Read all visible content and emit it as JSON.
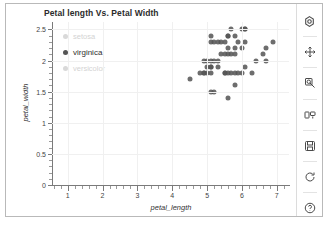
{
  "chart_data": {
    "type": "scatter",
    "title": "Petal length Vs. Petal Width",
    "xlabel": "petal_length",
    "ylabel": "petal_width",
    "xlim": [
      0.55,
      7.35
    ],
    "ylim": [
      0,
      2.62
    ],
    "xticks": [
      "1",
      "2",
      "3",
      "4",
      "5",
      "6",
      "7"
    ],
    "xtick_values": [
      1,
      2,
      3,
      4,
      5,
      6,
      7
    ],
    "yticks": [
      "0",
      "0.5",
      "1",
      "1.5",
      "2",
      "2.5"
    ],
    "ytick_values": [
      0,
      0.5,
      1,
      1.5,
      2,
      2.5
    ],
    "grid": true,
    "legend_position": "upper-left-inside",
    "series": [
      {
        "name": "setosa",
        "visible": false,
        "color": "#d9d9d9",
        "points": []
      },
      {
        "name": "versicolor",
        "visible": false,
        "color": "#d9d9d9",
        "points": []
      },
      {
        "name": "virginica",
        "visible": true,
        "color": "#555555",
        "points": [
          [
            4.5,
            1.7
          ],
          [
            4.8,
            1.8
          ],
          [
            4.9,
            1.8
          ],
          [
            5.0,
            1.8
          ],
          [
            5.1,
            1.8
          ],
          [
            4.9,
            2.0
          ],
          [
            5.0,
            2.0
          ],
          [
            5.1,
            2.0
          ],
          [
            5.2,
            2.0
          ],
          [
            5.3,
            2.0
          ],
          [
            5.0,
            1.9
          ],
          [
            5.1,
            1.9
          ],
          [
            5.1,
            1.5
          ],
          [
            5.2,
            1.5
          ],
          [
            5.1,
            2.3
          ],
          [
            5.2,
            2.3
          ],
          [
            5.3,
            2.3
          ],
          [
            5.4,
            2.3
          ],
          [
            5.5,
            2.3
          ],
          [
            5.1,
            2.4
          ],
          [
            5.5,
            2.1
          ],
          [
            5.6,
            2.1
          ],
          [
            5.7,
            2.1
          ],
          [
            5.8,
            2.1
          ],
          [
            5.6,
            2.4
          ],
          [
            6.0,
            2.5
          ],
          [
            6.1,
            2.5
          ],
          [
            5.6,
            2.2
          ],
          [
            5.8,
            2.2
          ],
          [
            5.6,
            1.8
          ],
          [
            5.7,
            1.8
          ],
          [
            5.8,
            1.8
          ],
          [
            5.5,
            1.8
          ],
          [
            5.9,
            1.8
          ],
          [
            5.4,
            2.1
          ],
          [
            5.6,
            1.4
          ],
          [
            5.7,
            2.5
          ],
          [
            5.8,
            1.6
          ],
          [
            6.0,
            1.8
          ],
          [
            6.1,
            1.9
          ],
          [
            6.1,
            2.3
          ],
          [
            6.3,
            1.8
          ],
          [
            6.6,
            2.1
          ],
          [
            6.7,
            2.0
          ],
          [
            6.7,
            2.2
          ],
          [
            6.9,
            2.3
          ],
          [
            6.4,
            2.0
          ],
          [
            6.1,
            2.5
          ],
          [
            5.9,
            2.3
          ],
          [
            5.3,
            1.9
          ],
          [
            5.5,
            1.8
          ],
          [
            5.1,
            1.9
          ],
          [
            5.8,
            2.4
          ],
          [
            6.0,
            2.2
          ],
          [
            4.9,
            1.8
          ],
          [
            5.6,
            2.4
          ]
        ]
      }
    ]
  },
  "legend": {
    "items": [
      {
        "label": "setosa",
        "state": "inactive"
      },
      {
        "label": "virginica",
        "state": "active"
      },
      {
        "label": "versicolor",
        "state": "inactive"
      }
    ]
  },
  "toolbar": {
    "buttons": [
      {
        "name": "home-icon",
        "tooltip": "Reset original view"
      },
      {
        "name": "pan-move-icon",
        "tooltip": "Pan axes"
      },
      {
        "name": "zoom-magnifier-icon",
        "tooltip": "Zoom to rectangle"
      },
      {
        "name": "configure-subplots-icon",
        "tooltip": "Configure subplots"
      },
      {
        "name": "save-floppy-icon",
        "tooltip": "Save the figure"
      },
      {
        "name": "refresh-icon",
        "tooltip": "Refresh"
      },
      {
        "name": "help-icon",
        "tooltip": "Help"
      }
    ]
  }
}
